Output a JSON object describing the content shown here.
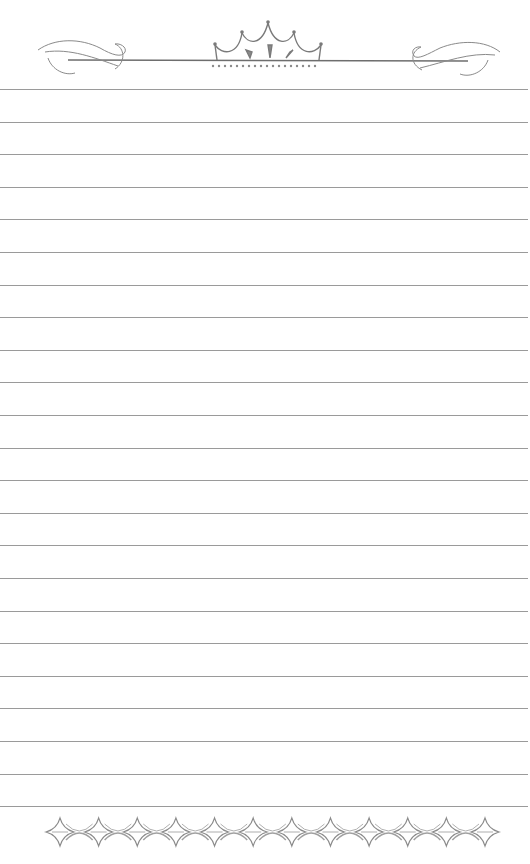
{
  "page": {
    "type": "lined-stationery",
    "background_color": "#ffffff",
    "line_color": "#9a9a9a",
    "ornament_color": "#8a8a8a"
  },
  "header": {
    "ornament": "crown-scroll-divider",
    "left_flourish": "scroll-flourish",
    "right_flourish": "scroll-flourish",
    "center_motif": "crown-swag",
    "bead_count": 18
  },
  "ruled_lines": {
    "count": 23,
    "first_y": 89,
    "spacing": 32.6
  },
  "footer": {
    "ornament": "four-point-star-chain",
    "star_count": 12
  }
}
